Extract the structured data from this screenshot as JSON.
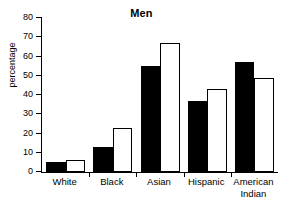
{
  "chart_data": {
    "type": "bar",
    "title": "Men",
    "xlabel": "",
    "ylabel": "percentage",
    "categories": [
      "White",
      "Black",
      "Asian",
      "Hispanic",
      "American\nIndian"
    ],
    "series": [
      {
        "name": "filled",
        "style": "black-filled",
        "values": [
          5,
          13,
          55,
          37,
          57
        ]
      },
      {
        "name": "open",
        "style": "white-open",
        "values": [
          6,
          23,
          67,
          43,
          49
        ]
      }
    ],
    "ylim": [
      0,
      80
    ],
    "ytick_values": [
      0,
      10,
      20,
      30,
      40,
      50,
      60,
      70,
      80
    ],
    "ytick_labels": [
      "0",
      "10",
      "20",
      "30",
      "40",
      "50",
      "60",
      "70",
      "80"
    ],
    "grid": false,
    "legend": "none",
    "colors": {
      "filled_bar": "#000000",
      "open_bar": "#ffffff",
      "axis": "#000000",
      "background": "#ffffff"
    }
  }
}
